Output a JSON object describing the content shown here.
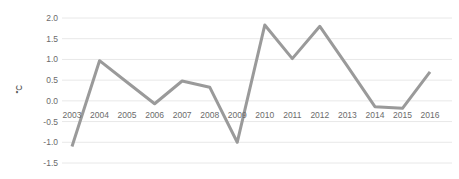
{
  "chart_data": {
    "type": "line",
    "title": "",
    "xlabel": "",
    "ylabel": "℃",
    "categories": [
      2003,
      2004,
      2005,
      2006,
      2007,
      2008,
      2009,
      2010,
      2011,
      2012,
      2013,
      2014,
      2015,
      2016
    ],
    "x_tick_labels": [
      "2003",
      "2004",
      "2005",
      "2006",
      "2007",
      "2008",
      "2009",
      "2010",
      "2011",
      "2012",
      "2013",
      "2014",
      "2015",
      "2016"
    ],
    "values": [
      -1.1,
      0.97,
      0.45,
      -0.07,
      0.48,
      0.33,
      -1.0,
      1.83,
      1.02,
      1.8,
      0.84,
      -0.14,
      -0.18,
      0.7
    ],
    "ylim": [
      -1.5,
      2.0
    ],
    "y_ticks": [
      2.0,
      1.5,
      1.0,
      0.5,
      0.0,
      -0.5,
      -1.0,
      -1.5
    ],
    "y_tick_labels": [
      "2.0",
      "1.5",
      "1.0",
      "0.5",
      "0.0",
      "-0.5",
      "-1.0",
      "-1.5"
    ],
    "grid": true,
    "grid_axis": "y",
    "legend": false,
    "legend_position": "none",
    "series_color": "#9a9a9a",
    "grid_color": "#e8e8e8",
    "tick_label_color": "#6b6b6b",
    "background_color": "#ffffff",
    "line_width": 3
  }
}
